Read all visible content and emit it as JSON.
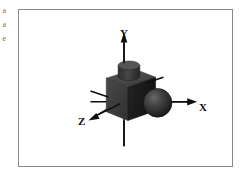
{
  "page": {
    "background_color": "#ffffff",
    "width": 244,
    "height": 176
  },
  "margin_text": {
    "fragment_1": "a",
    "fragment_2": "a",
    "fragment_3": "e"
  },
  "figure": {
    "name": "3d-coordinate-axes-with-cube-and-sphere",
    "frame_color": "#8a8a8a",
    "background_color": "#ffffff"
  },
  "axes": {
    "x": {
      "label": "X",
      "direction": "right",
      "arrow": true,
      "color": "#101010"
    },
    "y": {
      "label": "Y",
      "direction": "up",
      "arrow": true,
      "color": "#101010"
    },
    "z": {
      "label": "Z",
      "direction": "down-left",
      "arrow": true,
      "color": "#101010"
    }
  },
  "objects": {
    "cube": {
      "name": "cube",
      "front_face_color": "#3c3c3c",
      "top_face_color": "#4a4a4a",
      "side_face_color": "#1c1c1c"
    },
    "cylinder": {
      "name": "cylinder-on-cube-top",
      "body_color": "#3a3a3a",
      "cap_color": "#555555"
    },
    "sphere": {
      "name": "sphere",
      "base_color": "#2e2e2e",
      "highlight_color": "#595959"
    }
  }
}
